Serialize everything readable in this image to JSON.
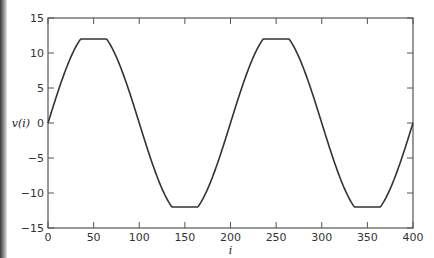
{
  "chart_data": {
    "type": "line",
    "title": "",
    "xlabel": "i",
    "ylabel": "v(i)",
    "xlim": [
      0,
      400
    ],
    "ylim": [
      -15,
      15
    ],
    "xticks": [
      0,
      50,
      100,
      150,
      200,
      250,
      300,
      350,
      400
    ],
    "yticks": [
      -15,
      -10,
      -5,
      0,
      5,
      10,
      15
    ],
    "xtick_labels": [
      "0",
      "50",
      "100",
      "150",
      "200",
      "250",
      "300",
      "350",
      "400"
    ],
    "ytick_labels": [
      "−15",
      "−10",
      "−5",
      "0",
      "5",
      "10",
      "15"
    ],
    "grid": false,
    "legend": null,
    "series": [
      {
        "name": "v(i)",
        "x": [
          0,
          10,
          20,
          30,
          36,
          40,
          50,
          60,
          64,
          70,
          80,
          90,
          100,
          110,
          120,
          130,
          136,
          140,
          150,
          160,
          164,
          170,
          180,
          190,
          200,
          210,
          220,
          230,
          236,
          240,
          250,
          260,
          264,
          270,
          280,
          290,
          300,
          310,
          320,
          330,
          336,
          340,
          350,
          360,
          364,
          370,
          380,
          390,
          400
        ],
        "values": [
          0,
          4.1,
          7.8,
          10.8,
          12,
          12,
          12,
          12,
          12,
          10.8,
          7.8,
          4.1,
          0,
          -4.1,
          -7.8,
          -10.8,
          -12,
          -12,
          -12,
          -12,
          -12,
          -10.8,
          -7.8,
          -4.1,
          0,
          4.1,
          7.8,
          10.8,
          12,
          12,
          12,
          12,
          12,
          10.8,
          7.8,
          4.1,
          0,
          -4.1,
          -7.8,
          -10.8,
          -12,
          -12,
          -12,
          -12,
          -12,
          -10.8,
          -7.8,
          -4.1,
          0
        ]
      }
    ]
  },
  "plot": {
    "left": 48,
    "right": 413,
    "top": 18,
    "bottom": 228,
    "amplitude": 13.3,
    "clip": 12,
    "period": 200,
    "line_color": "#333333",
    "axis_color": "#555555"
  }
}
